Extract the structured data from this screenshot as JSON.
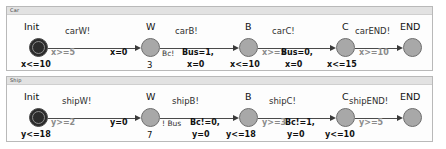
{
  "panels": [
    {
      "title": "Car",
      "states": [
        {
          "name": "Init",
          "type": "initial"
        },
        {
          "name": "W",
          "type": "normal"
        },
        {
          "name": "B",
          "type": "normal"
        },
        {
          "name": "C",
          "type": "normal"
        },
        {
          "name": "END",
          "type": "normal"
        }
      ],
      "transitions": [
        {
          "sync": "carW!",
          "guard": "x>=5",
          "assign": "x=0",
          "channel": "Bc!"
        },
        {
          "sync": "carB!",
          "guard": "x>=5",
          "assign": "Bus=1,\nx=0",
          "channel": ""
        },
        {
          "sync": "carC!",
          "guard": "x>=10",
          "assign": "Bus=0,\nx=0",
          "channel": ""
        },
        {
          "sync": "carEND!",
          "guard": "",
          "assign": "",
          "channel": ""
        }
      ],
      "labels": {
        "init_invariant": "x<=10",
        "w_count": "3",
        "b_invariant": "x<=10",
        "c_invariant": "x<=15",
        "edge1_guard": "x>=5",
        "edge1_assign": "x=0",
        "edge2_assign": "Bus=1,",
        "edge2_assign2": "x=0",
        "edge2_guard": "x>=5",
        "edge3_assign": "Bus=0,",
        "edge3_assign2": "x=0",
        "edge3_guard": "x>=10",
        "channel_w": "Bc!"
      }
    },
    {
      "title": "Ship",
      "states": [
        {
          "name": "Init",
          "type": "initial"
        },
        {
          "name": "W",
          "type": "normal"
        },
        {
          "name": "B",
          "type": "normal"
        },
        {
          "name": "C",
          "type": "normal"
        },
        {
          "name": "END",
          "type": "normal"
        }
      ],
      "transitions": [
        {
          "sync": "shipW!",
          "guard": "y>=2",
          "assign": "y=0",
          "channel": "! Bus"
        },
        {
          "sync": "shipB!",
          "guard": "y>=3",
          "assign": "Bc!=0,\ny=0",
          "channel": ""
        },
        {
          "sync": "shipC!",
          "guard": "y>=5",
          "assign": "Bc!=1,\ny=0",
          "channel": ""
        },
        {
          "sync": "shipEND!",
          "guard": "",
          "assign": "",
          "channel": ""
        }
      ],
      "labels": {
        "init_invariant": "y<=18",
        "w_count": "7",
        "b_invariant": "y<=18",
        "c_invariant": "y<=10",
        "edge1_guard": "y>=2",
        "edge1_assign": "y=0",
        "edge2_assign": "Bc!=0,",
        "edge2_assign2": "y=0",
        "edge2_guard": "y>=3",
        "edge3_assign": "Bc!=1,",
        "edge3_assign2": "y=0",
        "edge3_guard": "y>=5",
        "channel_w": "! Bus"
      }
    }
  ]
}
